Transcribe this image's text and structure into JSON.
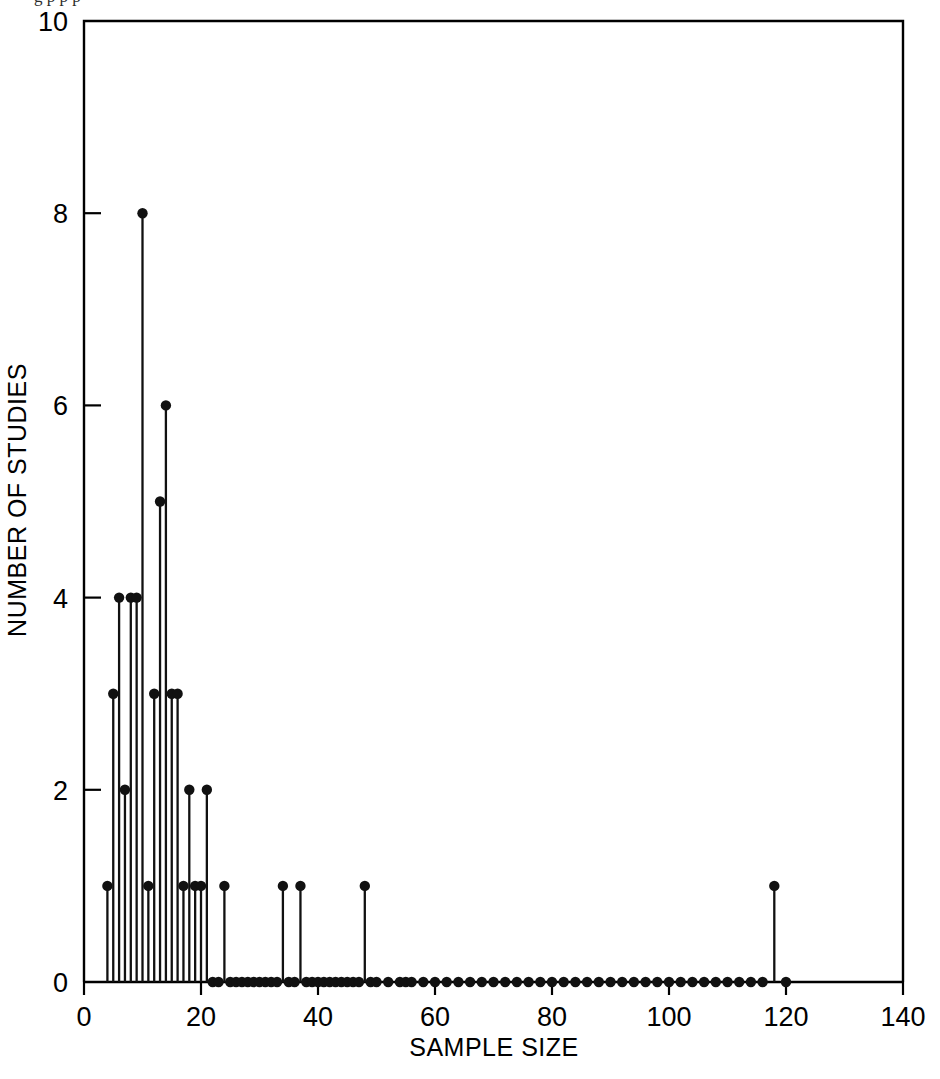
{
  "figure": {
    "cropped_caption": "g                     p         p       p",
    "background_color": "#ffffff",
    "ink_color": "#111111"
  },
  "chart_data": {
    "type": "scatter",
    "subtype": "stem-needle-plot",
    "title": "",
    "xlabel": "SAMPLE SIZE",
    "ylabel": "NUMBER OF STUDIES",
    "xlim": [
      0,
      140
    ],
    "ylim": [
      0,
      10
    ],
    "xticks": [
      0,
      20,
      40,
      60,
      80,
      100,
      120,
      140
    ],
    "xtick_labels": [
      "0",
      "20",
      "40",
      "60",
      "80",
      "100",
      "120",
      "140"
    ],
    "yticks": [
      0,
      2,
      4,
      6,
      8,
      10
    ],
    "ytick_labels": [
      "0",
      "2",
      "4",
      "6",
      "8",
      "10"
    ],
    "grid": false,
    "legend": false,
    "marker": "filled-circle",
    "x": [
      4,
      5,
      6,
      7,
      8,
      9,
      10,
      11,
      12,
      13,
      14,
      15,
      16,
      17,
      18,
      19,
      20,
      21,
      22,
      23,
      24,
      25,
      26,
      27,
      28,
      29,
      30,
      31,
      32,
      33,
      34,
      35,
      36,
      37,
      38,
      39,
      40,
      41,
      42,
      43,
      44,
      45,
      46,
      47,
      48,
      49,
      50,
      52,
      54,
      55,
      56,
      58,
      60,
      62,
      64,
      66,
      68,
      70,
      72,
      74,
      76,
      78,
      80,
      82,
      84,
      86,
      88,
      90,
      92,
      94,
      96,
      98,
      100,
      102,
      104,
      106,
      108,
      110,
      112,
      114,
      116,
      118,
      120
    ],
    "y": [
      1,
      3,
      4,
      2,
      4,
      4,
      8,
      1,
      3,
      5,
      6,
      3,
      3,
      1,
      2,
      1,
      1,
      2,
      0,
      0,
      1,
      0,
      0,
      0,
      0,
      0,
      0,
      0,
      0,
      0,
      1,
      0,
      0,
      1,
      0,
      0,
      0,
      0,
      0,
      0,
      0,
      0,
      0,
      0,
      1,
      0,
      0,
      0,
      0,
      0,
      0,
      0,
      0,
      0,
      0,
      0,
      0,
      0,
      0,
      0,
      0,
      0,
      0,
      0,
      0,
      0,
      0,
      0,
      0,
      0,
      0,
      0,
      0,
      0,
      0,
      0,
      0,
      0,
      0,
      0,
      0,
      1,
      0
    ]
  }
}
